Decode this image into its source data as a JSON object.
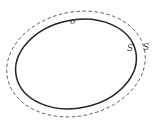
{
  "diagram": {
    "colors": {
      "background": "#ffffff",
      "solid_curve": "#222222",
      "dashed_curve": "#555555",
      "label": "#3a3a3a"
    },
    "shapes": [
      {
        "name": "inner-closed-curve",
        "style": "solid",
        "label": "σ"
      },
      {
        "name": "outer-closed-curve",
        "style": "dashed"
      }
    ],
    "labels": {
      "sigma": "σ",
      "inner_surface": "S",
      "outer_surface": "S"
    }
  }
}
